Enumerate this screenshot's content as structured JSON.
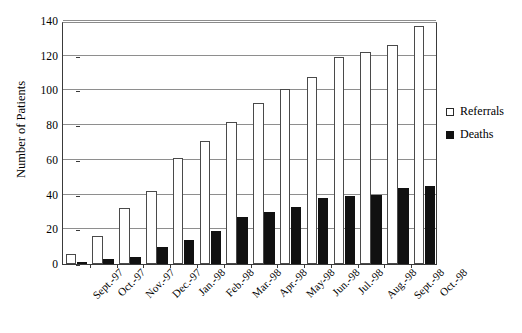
{
  "chart_data": {
    "type": "bar",
    "title": "",
    "subtitle": "",
    "xlabel": "",
    "ylabel": "Number of Patients",
    "categories": [
      "Sept.-97",
      "Oct.-97",
      "Nov.-97",
      "Dec.-97",
      "Jan.-98",
      "Feb.-98",
      "Mar.-98",
      "Apr.-98",
      "May-98",
      "Jun.-98",
      "Jul.-98",
      "Aug.-98",
      "Sept.-98",
      "Oct.-98"
    ],
    "series": [
      {
        "name": "Referrals",
        "color": "#ffffff",
        "values": [
          6,
          16,
          32,
          42,
          61,
          71,
          82,
          93,
          101,
          108,
          119,
          122,
          126,
          137
        ]
      },
      {
        "name": "Deaths",
        "color": "#111111",
        "values": [
          0,
          3,
          4,
          10,
          14,
          19,
          27,
          30,
          33,
          38,
          39,
          40,
          44,
          45
        ]
      }
    ],
    "ylim": [
      0,
      140
    ],
    "yticks": [
      0,
      20,
      40,
      60,
      80,
      100,
      120,
      140
    ],
    "ytick_labels": [
      "0",
      "20",
      "40",
      "60",
      "80",
      "100",
      "120",
      "140"
    ],
    "grid": true,
    "grid_axis": "y",
    "legend_position": "right",
    "bar_mode": "grouped",
    "xtick_label_rotation": -45
  },
  "legend": {
    "entries": [
      {
        "label": "Referrals",
        "swatch": "open-square"
      },
      {
        "label": "Deaths",
        "swatch": "filled-square"
      }
    ]
  },
  "axes": {
    "y_title": "Number of Patients"
  }
}
